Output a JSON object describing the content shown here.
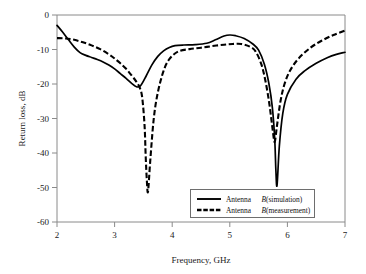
{
  "chart_data": {
    "type": "line",
    "title": "",
    "xlabel": "Frequency, GHz",
    "ylabel": "Return loss, dB",
    "xlim": [
      2,
      7
    ],
    "ylim": [
      -60,
      0
    ],
    "xticks": [
      2,
      3,
      4,
      5,
      6,
      7
    ],
    "yticks": [
      0,
      -10,
      -20,
      -30,
      -40,
      -50,
      -60
    ],
    "xtick_labels": [
      "2",
      "3",
      "4",
      "5",
      "6",
      "7"
    ],
    "ytick_labels": [
      "0",
      "-10",
      "-20",
      "-30",
      "-40",
      "-50",
      "-60"
    ],
    "grid": false,
    "legend_position": "lower right",
    "series": [
      {
        "name": "Antenna B (simulation)",
        "name_prefix": "Antenna ",
        "name_italic": "B",
        "name_suffix": " (simulation)",
        "style": "solid",
        "color": "#000000",
        "x": [
          2.0,
          2.1,
          2.2,
          2.3,
          2.4,
          2.5,
          2.6,
          2.7,
          2.8,
          2.9,
          3.0,
          3.1,
          3.2,
          3.3,
          3.38,
          3.45,
          3.55,
          3.65,
          3.75,
          3.85,
          3.95,
          4.05,
          4.2,
          4.4,
          4.6,
          4.75,
          4.9,
          5.0,
          5.1,
          5.25,
          5.4,
          5.5,
          5.6,
          5.68,
          5.74,
          5.78,
          5.8,
          5.82,
          5.86,
          5.92,
          6.0,
          6.15,
          6.3,
          6.5,
          6.7,
          6.85,
          7.0
        ],
        "y": [
          -3.0,
          -5.0,
          -7.2,
          -9.3,
          -10.9,
          -11.7,
          -12.3,
          -12.9,
          -13.6,
          -14.5,
          -15.6,
          -17.0,
          -18.4,
          -19.9,
          -20.8,
          -20.5,
          -17.6,
          -14.4,
          -12.0,
          -10.4,
          -9.4,
          -8.9,
          -8.7,
          -8.6,
          -8.2,
          -7.2,
          -6.1,
          -5.8,
          -6.0,
          -6.8,
          -8.4,
          -10.2,
          -14.3,
          -20.0,
          -27.0,
          -36.0,
          -45.0,
          -49.4,
          -38.0,
          -28.5,
          -23.0,
          -18.6,
          -16.2,
          -14.0,
          -12.3,
          -11.4,
          -10.8
        ]
      },
      {
        "name": "Antenna B (measurement)",
        "name_prefix": "Antenna ",
        "name_italic": "B",
        "name_suffix": " (measurement)",
        "style": "dashed",
        "color": "#000000",
        "x": [
          2.0,
          2.15,
          2.3,
          2.45,
          2.6,
          2.75,
          2.9,
          3.0,
          3.1,
          3.2,
          3.3,
          3.38,
          3.44,
          3.48,
          3.52,
          3.54,
          3.56,
          3.58,
          3.62,
          3.68,
          3.75,
          3.85,
          3.95,
          4.1,
          4.3,
          4.5,
          4.7,
          4.9,
          5.05,
          5.2,
          5.35,
          5.45,
          5.55,
          5.62,
          5.68,
          5.72,
          5.75,
          5.78,
          5.82,
          5.88,
          5.95,
          6.05,
          6.2,
          6.4,
          6.6,
          6.8,
          7.0
        ],
        "y": [
          -6.7,
          -6.8,
          -7.2,
          -7.9,
          -8.8,
          -9.9,
          -11.4,
          -12.6,
          -14.0,
          -15.6,
          -17.6,
          -19.4,
          -21.2,
          -24.0,
          -32.0,
          -41.0,
          -48.0,
          -51.2,
          -42.0,
          -30.0,
          -22.5,
          -16.2,
          -12.8,
          -10.6,
          -9.9,
          -9.5,
          -9.0,
          -8.6,
          -8.4,
          -8.4,
          -9.2,
          -10.6,
          -14.4,
          -19.2,
          -25.0,
          -30.0,
          -34.0,
          -36.8,
          -32.0,
          -25.0,
          -20.0,
          -16.0,
          -12.5,
          -9.5,
          -7.4,
          -5.8,
          -4.5
        ]
      }
    ]
  },
  "axes": {
    "x_axis_label": "Frequency, GHz",
    "y_axis_label": "Return loss, dB"
  },
  "legend": {
    "entries": [
      {
        "prefix": "Antenna ",
        "italic": "B",
        "suffix": " (simulation)",
        "style": "solid"
      },
      {
        "prefix": "Antenna ",
        "italic": "B",
        "suffix": " (measurement)",
        "style": "dashed"
      }
    ]
  }
}
